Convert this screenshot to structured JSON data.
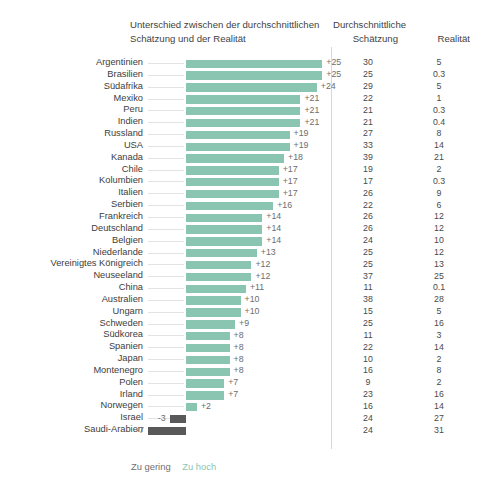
{
  "header": {
    "diff_title_line1": "Unterschied zwischen der durchschnittlichen",
    "diff_title_line2": "Schätzung und der Realität",
    "est_title_line1": "Durchschnittliche",
    "est_title_line2": "Schätzung",
    "real_title": "Realität"
  },
  "legend": {
    "too_low": "Zu gering",
    "too_high": "Zu hoch"
  },
  "colors": {
    "positive_bar": "#8ac5b1",
    "negative_bar": "#595959",
    "text": "#3d3d3d",
    "divider": "#d8d8d8"
  },
  "chart_data": {
    "type": "bar",
    "title": "Unterschied zwischen der durchschnittlichen Schätzung und der Realität",
    "xlabel": "",
    "ylabel": "",
    "orientation": "horizontal",
    "grid": false,
    "legend_position": "bottom-left",
    "xlim": [
      -8,
      26
    ],
    "categories": [
      "Argentinien",
      "Brasilien",
      "Südafrika",
      "Mexiko",
      "Peru",
      "Indien",
      "Russland",
      "USA",
      "Kanada",
      "Chile",
      "Kolumbien",
      "Italien",
      "Serbien",
      "Frankreich",
      "Deutschland",
      "Belgien",
      "Niederlande",
      "Vereinigtes Königreich",
      "Neuseeland",
      "China",
      "Australien",
      "Ungarn",
      "Schweden",
      "Südkorea",
      "Spanien",
      "Japan",
      "Montenegro",
      "Polen",
      "Irland",
      "Norwegen",
      "Israel",
      "Saudi-Arabien"
    ],
    "series": [
      {
        "name": "Unterschied (Schätzung − Realität)",
        "values": [
          25,
          25,
          24,
          21,
          21,
          21,
          19,
          19,
          18,
          17,
          17,
          17,
          16,
          14,
          14,
          14,
          13,
          12,
          12,
          11,
          10,
          10,
          9,
          8,
          8,
          8,
          8,
          7,
          7,
          2,
          -3,
          -7
        ]
      },
      {
        "name": "Durchschnittliche Schätzung",
        "values": [
          30,
          25,
          29,
          22,
          21,
          21,
          27,
          33,
          39,
          19,
          17,
          26,
          22,
          26,
          26,
          24,
          25,
          25,
          37,
          11,
          38,
          15,
          25,
          11,
          22,
          10,
          16,
          9,
          23,
          16,
          24,
          24
        ]
      },
      {
        "name": "Realität",
        "values": [
          5,
          0.3,
          5,
          1,
          0.3,
          0.4,
          8,
          14,
          21,
          2,
          0.3,
          9,
          6,
          12,
          12,
          10,
          12,
          13,
          25,
          0.1,
          28,
          5,
          16,
          3,
          14,
          2,
          8,
          2,
          16,
          14,
          27,
          31
        ]
      }
    ]
  },
  "rows": [
    {
      "country": "Argentinien",
      "diff": 25,
      "diff_label": "+25",
      "est": "30",
      "real": "5"
    },
    {
      "country": "Brasilien",
      "diff": 25,
      "diff_label": "+25",
      "est": "25",
      "real": "0.3"
    },
    {
      "country": "Südafrika",
      "diff": 24,
      "diff_label": "+24",
      "est": "29",
      "real": "5"
    },
    {
      "country": "Mexiko",
      "diff": 21,
      "diff_label": "+21",
      "est": "22",
      "real": "1"
    },
    {
      "country": "Peru",
      "diff": 21,
      "diff_label": "+21",
      "est": "21",
      "real": "0.3"
    },
    {
      "country": "Indien",
      "diff": 21,
      "diff_label": "+21",
      "est": "21",
      "real": "0.4"
    },
    {
      "country": "Russland",
      "diff": 19,
      "diff_label": "+19",
      "est": "27",
      "real": "8"
    },
    {
      "country": "USA",
      "diff": 19,
      "diff_label": "+19",
      "est": "33",
      "real": "14"
    },
    {
      "country": "Kanada",
      "diff": 18,
      "diff_label": "+18",
      "est": "39",
      "real": "21"
    },
    {
      "country": "Chile",
      "diff": 17,
      "diff_label": "+17",
      "est": "19",
      "real": "2"
    },
    {
      "country": "Kolumbien",
      "diff": 17,
      "diff_label": "+17",
      "est": "17",
      "real": "0.3"
    },
    {
      "country": "Italien",
      "diff": 17,
      "diff_label": "+17",
      "est": "26",
      "real": "9"
    },
    {
      "country": "Serbien",
      "diff": 16,
      "diff_label": "+16",
      "est": "22",
      "real": "6"
    },
    {
      "country": "Frankreich",
      "diff": 14,
      "diff_label": "+14",
      "est": "26",
      "real": "12"
    },
    {
      "country": "Deutschland",
      "diff": 14,
      "diff_label": "+14",
      "est": "26",
      "real": "12"
    },
    {
      "country": "Belgien",
      "diff": 14,
      "diff_label": "+14",
      "est": "24",
      "real": "10"
    },
    {
      "country": "Niederlande",
      "diff": 13,
      "diff_label": "+13",
      "est": "25",
      "real": "12"
    },
    {
      "country": "Vereinigtes Königreich",
      "diff": 12,
      "diff_label": "+12",
      "est": "25",
      "real": "13"
    },
    {
      "country": "Neuseeland",
      "diff": 12,
      "diff_label": "+12",
      "est": "37",
      "real": "25"
    },
    {
      "country": "China",
      "diff": 11,
      "diff_label": "+11",
      "est": "11",
      "real": "0.1"
    },
    {
      "country": "Australien",
      "diff": 10,
      "diff_label": "+10",
      "est": "38",
      "real": "28"
    },
    {
      "country": "Ungarn",
      "diff": 10,
      "diff_label": "+10",
      "est": "15",
      "real": "5"
    },
    {
      "country": "Schweden",
      "diff": 9,
      "diff_label": "+9",
      "est": "25",
      "real": "16"
    },
    {
      "country": "Südkorea",
      "diff": 8,
      "diff_label": "+8",
      "est": "11",
      "real": "3"
    },
    {
      "country": "Spanien",
      "diff": 8,
      "diff_label": "+8",
      "est": "22",
      "real": "14"
    },
    {
      "country": "Japan",
      "diff": 8,
      "diff_label": "+8",
      "est": "10",
      "real": "2"
    },
    {
      "country": "Montenegro",
      "diff": 8,
      "diff_label": "+8",
      "est": "16",
      "real": "8"
    },
    {
      "country": "Polen",
      "diff": 7,
      "diff_label": "+7",
      "est": "9",
      "real": "2"
    },
    {
      "country": "Irland",
      "diff": 7,
      "diff_label": "+7",
      "est": "23",
      "real": "16"
    },
    {
      "country": "Norwegen",
      "diff": 2,
      "diff_label": "+2",
      "est": "16",
      "real": "14"
    },
    {
      "country": "Israel",
      "diff": -3,
      "diff_label": "-3",
      "est": "24",
      "real": "27"
    },
    {
      "country": "Saudi-Arabien",
      "diff": -7,
      "diff_label": "-7",
      "est": "24",
      "real": "31"
    }
  ]
}
